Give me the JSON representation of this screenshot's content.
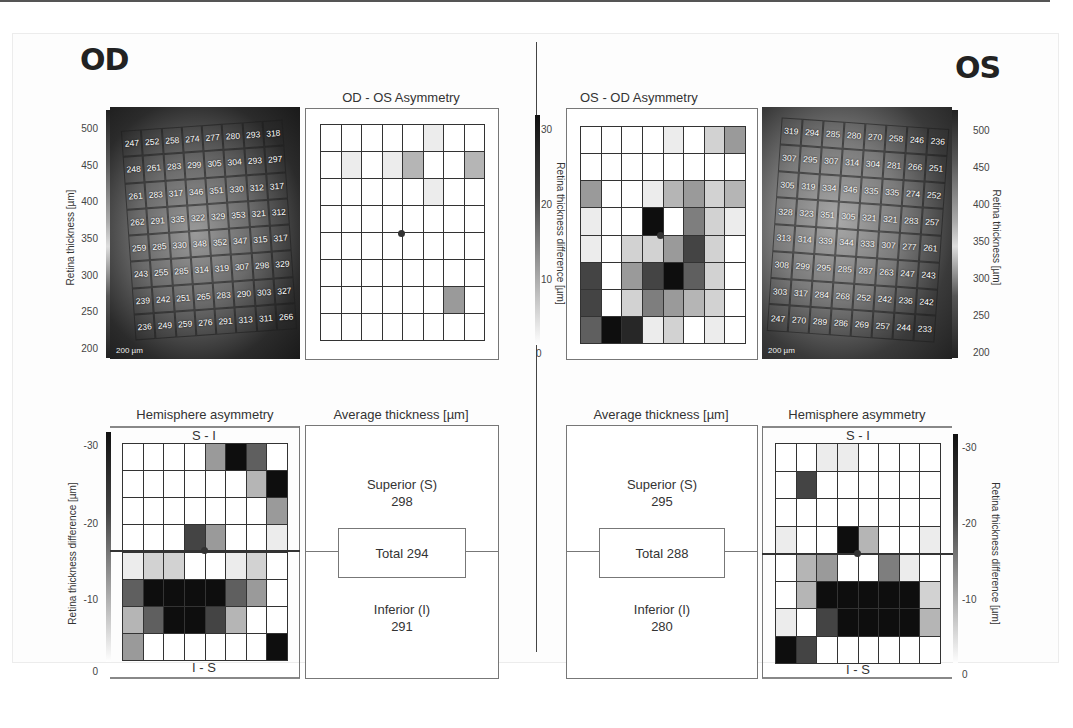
{
  "od": {
    "eye_label": "OD",
    "asymmetry_title": "OD - OS Asymmetry",
    "hemisphere_title": "Hemisphere asymmetry",
    "average_title": "Average thickness [µm]",
    "top_label": "S - I",
    "bottom_label": "I - S",
    "average": {
      "superior_label": "Superior (S)",
      "superior_value": "298",
      "total_label": "Total 294",
      "inferior_label": "Inferior (I)",
      "inferior_value": "291"
    },
    "thickness_axis": {
      "label": "Retina thickness [µm]",
      "ticks": [
        "500",
        "450",
        "400",
        "350",
        "300",
        "250",
        "200"
      ]
    },
    "difference_axis": {
      "label": "Retina thickness difference [µm]",
      "ticks": [
        "-30",
        "-20",
        "-10",
        "0"
      ]
    },
    "scale_bar": "200 µm",
    "fundus_values": [
      [
        "247",
        "252",
        "258",
        "274",
        "277",
        "280",
        "293",
        "318"
      ],
      [
        "248",
        "261",
        "283",
        "299",
        "305",
        "304",
        "293",
        "297"
      ],
      [
        "261",
        "283",
        "317",
        "346",
        "351",
        "330",
        "312",
        "317"
      ],
      [
        "262",
        "291",
        "335",
        "322",
        "329",
        "353",
        "321",
        "312"
      ],
      [
        "259",
        "285",
        "330",
        "348",
        "352",
        "347",
        "315",
        "317"
      ],
      [
        "243",
        "255",
        "285",
        "314",
        "319",
        "307",
        "298",
        "329"
      ],
      [
        "239",
        "242",
        "251",
        "265",
        "283",
        "290",
        "303",
        "327"
      ],
      [
        "236",
        "249",
        "259",
        "276",
        "291",
        "313",
        "311",
        "266"
      ]
    ],
    "asymmetry_grid": [
      [
        0,
        0,
        0,
        0,
        0,
        1,
        0,
        0
      ],
      [
        0,
        1,
        0,
        1,
        3,
        0,
        0,
        3
      ],
      [
        0,
        0,
        0,
        0,
        0,
        1,
        0,
        0
      ],
      [
        0,
        0,
        0,
        0,
        0,
        0,
        0,
        0
      ],
      [
        0,
        0,
        0,
        0,
        0,
        0,
        0,
        0
      ],
      [
        0,
        0,
        0,
        0,
        0,
        0,
        0,
        0
      ],
      [
        0,
        0,
        0,
        0,
        0,
        0,
        4,
        0
      ],
      [
        0,
        0,
        0,
        0,
        0,
        0,
        0,
        0
      ]
    ],
    "hemisphere_grid": [
      [
        0,
        0,
        0,
        0,
        4,
        9,
        6,
        0
      ],
      [
        0,
        0,
        0,
        0,
        0,
        0,
        3,
        9
      ],
      [
        0,
        0,
        0,
        0,
        0,
        0,
        0,
        4
      ],
      [
        0,
        0,
        0,
        7,
        4,
        0,
        0,
        1
      ],
      [
        1,
        2,
        2,
        0,
        0,
        1,
        2,
        0
      ],
      [
        6,
        9,
        9,
        9,
        9,
        6,
        4,
        0
      ],
      [
        3,
        6,
        9,
        9,
        7,
        3,
        0,
        0
      ],
      [
        4,
        0,
        0,
        0,
        0,
        0,
        0,
        9
      ]
    ]
  },
  "os": {
    "eye_label": "OS",
    "asymmetry_title": "OS - OD Asymmetry",
    "hemisphere_title": "Hemisphere asymmetry",
    "average_title": "Average thickness [µm]",
    "top_label": "S - I",
    "bottom_label": "I - S",
    "average": {
      "superior_label": "Superior (S)",
      "superior_value": "295",
      "total_label": "Total 288",
      "inferior_label": "Inferior (I)",
      "inferior_value": "280"
    },
    "thickness_axis": {
      "label": "Retina thickness [µm]",
      "ticks": [
        "500",
        "450",
        "400",
        "350",
        "300",
        "250",
        "200"
      ]
    },
    "difference_axis": {
      "label": "Retina thickness difference [µm]",
      "ticks": [
        "30",
        "20",
        "10",
        "0"
      ]
    },
    "hemi_axis_ticks": [
      "-30",
      "-20",
      "-10",
      "0"
    ],
    "scale_bar": "200 µm",
    "fundus_values": [
      [
        "319",
        "294",
        "285",
        "280",
        "270",
        "258",
        "246",
        "236"
      ],
      [
        "307",
        "295",
        "307",
        "314",
        "304",
        "281",
        "266",
        "251"
      ],
      [
        "305",
        "319",
        "334",
        "346",
        "335",
        "335",
        "274",
        "252"
      ],
      [
        "328",
        "323",
        "351",
        "305",
        "321",
        "321",
        "283",
        "257"
      ],
      [
        "313",
        "314",
        "339",
        "344",
        "333",
        "307",
        "277",
        "261"
      ],
      [
        "308",
        "299",
        "295",
        "285",
        "287",
        "263",
        "247",
        "243"
      ],
      [
        "303",
        "317",
        "284",
        "268",
        "252",
        "242",
        "236",
        "242"
      ],
      [
        "247",
        "270",
        "289",
        "286",
        "269",
        "257",
        "244",
        "233"
      ]
    ],
    "asymmetry_grid": [
      [
        0,
        0,
        0,
        0,
        1,
        0,
        2,
        4
      ],
      [
        0,
        0,
        0,
        0,
        0,
        0,
        0,
        0
      ],
      [
        4,
        0,
        0,
        1,
        3,
        4,
        2,
        3
      ],
      [
        1,
        0,
        0,
        9,
        0,
        5,
        2,
        1
      ],
      [
        1,
        0,
        2,
        2,
        4,
        7,
        2,
        0
      ],
      [
        7,
        0,
        4,
        7,
        9,
        6,
        2,
        0
      ],
      [
        7,
        0,
        2,
        5,
        4,
        3,
        2,
        0
      ],
      [
        6,
        9,
        8,
        1,
        2,
        0,
        1,
        0
      ]
    ],
    "hemisphere_grid": [
      [
        0,
        0,
        1,
        1,
        0,
        0,
        0,
        0
      ],
      [
        0,
        7,
        0,
        0,
        0,
        0,
        0,
        0
      ],
      [
        0,
        0,
        0,
        0,
        0,
        0,
        0,
        0
      ],
      [
        1,
        0,
        0,
        9,
        3,
        0,
        0,
        1
      ],
      [
        0,
        3,
        4,
        0,
        0,
        5,
        1,
        0
      ],
      [
        0,
        3,
        9,
        9,
        9,
        9,
        9,
        2
      ],
      [
        1,
        0,
        7,
        9,
        9,
        9,
        9,
        3
      ],
      [
        9,
        7,
        0,
        0,
        0,
        0,
        0,
        0
      ]
    ]
  },
  "colors": {
    "scale": [
      "#ffffff",
      "#ececec",
      "#d2d2d2",
      "#b5b5b5",
      "#9a9a9a",
      "#7e7e7e",
      "#5f5f5f",
      "#444444",
      "#272727",
      "#0e0e0e"
    ],
    "grid_line": "#333333",
    "text": "#333333"
  }
}
